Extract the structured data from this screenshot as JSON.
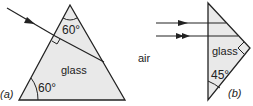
{
  "diagram": {
    "colors": {
      "line": "#222222",
      "glass_fill": "#e9e9e9",
      "background": "#ffffff"
    },
    "part_a": {
      "label": "(a)",
      "material_label": "glass",
      "apex_angle": "60°",
      "base_angle": "60°",
      "shape": "equilateral prism",
      "ray": "single incident ray entering left face at normal incidence"
    },
    "part_b": {
      "label": "(b)",
      "medium_label": "air",
      "material_label": "glass",
      "angle": "45°",
      "shape": "right-angled isosceles prism",
      "rays": [
        "parallel ray (single arrow)",
        "parallel ray (double arrow)"
      ]
    }
  }
}
